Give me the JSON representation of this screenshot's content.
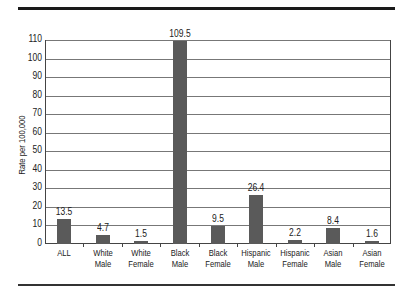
{
  "chart_data": {
    "type": "bar",
    "title": "",
    "xlabel": "",
    "ylabel": "Rate per 100,000",
    "ylim": [
      0,
      110
    ],
    "yticks": [
      0,
      10,
      20,
      30,
      40,
      50,
      60,
      70,
      80,
      90,
      100,
      110
    ],
    "grid": true,
    "legend": null,
    "categories": [
      "ALL",
      "White Male",
      "White Female",
      "Black Male",
      "Black Female",
      "Hispanic Male",
      "Hispanic Female",
      "Asian Male",
      "Asian Female"
    ],
    "category_lines": [
      [
        "ALL"
      ],
      [
        "White",
        "Male"
      ],
      [
        "White",
        "Female"
      ],
      [
        "Black",
        "Male"
      ],
      [
        "Black",
        "Female"
      ],
      [
        "Hispanic",
        "Male"
      ],
      [
        "Hispanic",
        "Female"
      ],
      [
        "Asian",
        "Male"
      ],
      [
        "Asian",
        "Female"
      ]
    ],
    "values": [
      13.5,
      4.7,
      1.5,
      109.5,
      9.5,
      26.4,
      2.2,
      8.4,
      1.6
    ],
    "value_labels": [
      "13.5",
      "4.7",
      "1.5",
      "109.5",
      "9.5",
      "26.4",
      "2.2",
      "8.4",
      "1.6"
    ],
    "bar_color": "#5a5a5a"
  }
}
